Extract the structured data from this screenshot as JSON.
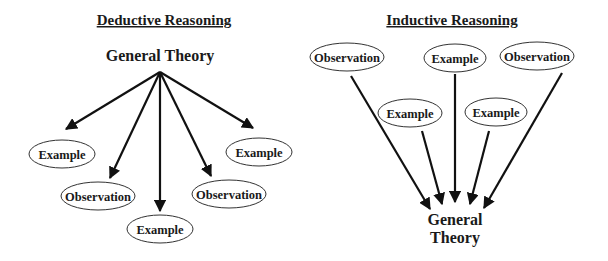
{
  "deductive": {
    "title": "Deductive Reasoning",
    "source": "General Theory",
    "nodes": [
      {
        "label": "Example"
      },
      {
        "label": "Observation"
      },
      {
        "label": "Example"
      },
      {
        "label": "Observation"
      },
      {
        "label": "Example"
      }
    ]
  },
  "inductive": {
    "title": "Inductive Reasoning",
    "nodes": [
      {
        "label": "Observation"
      },
      {
        "label": "Example"
      },
      {
        "label": "Observation"
      },
      {
        "label": "Example"
      },
      {
        "label": "Example"
      }
    ],
    "target_line1": "General",
    "target_line2": "Theory"
  }
}
